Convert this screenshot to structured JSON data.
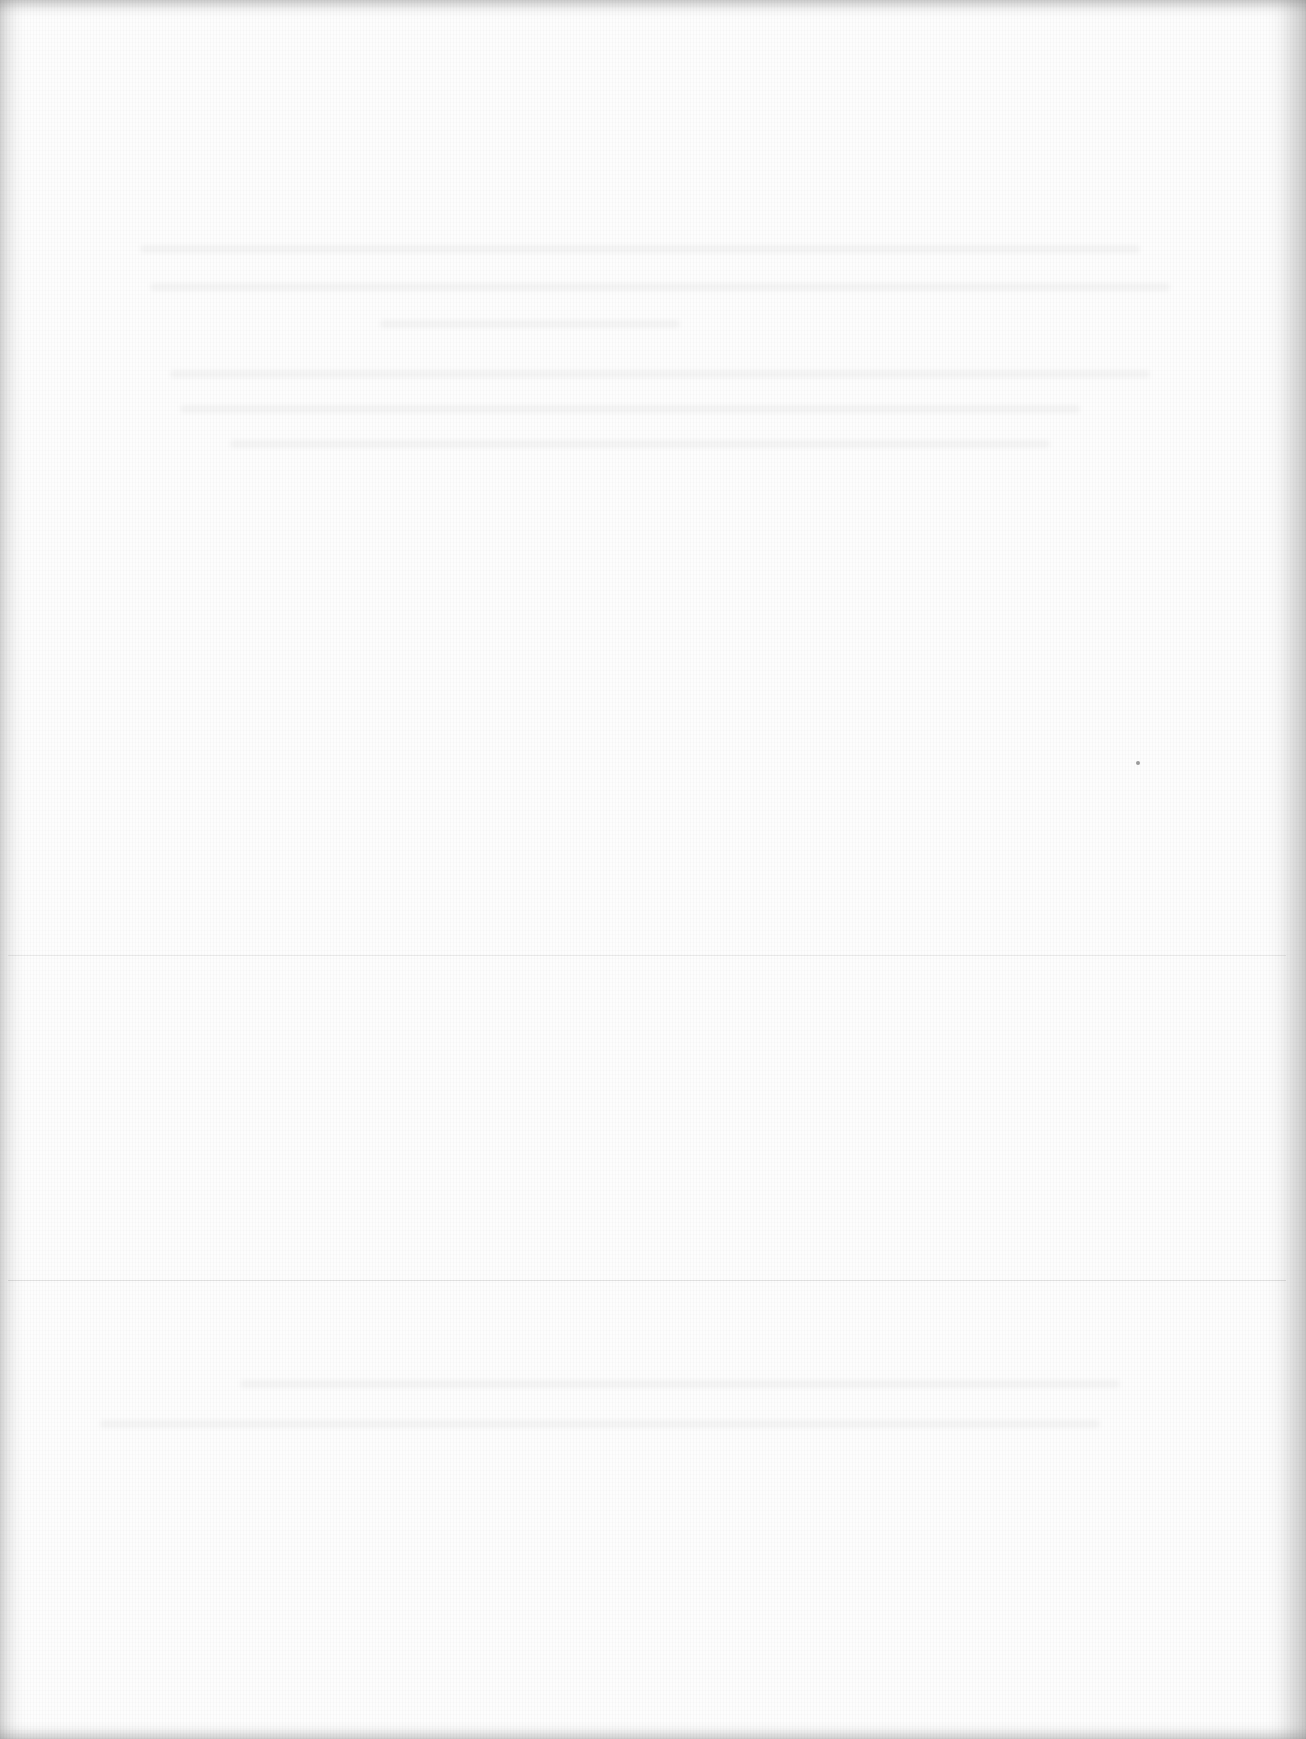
{
  "page": {
    "type": "blank scanned page",
    "background_color": "#fdfdfd",
    "edge_shadow_color": "#c8c8c8",
    "legible_text": []
  },
  "rules": [
    {
      "y": 955,
      "color": "#e4e4e4"
    },
    {
      "y": 1280,
      "color": "#dcdcdc"
    }
  ],
  "marks": [
    {
      "x": 1138,
      "y": 763,
      "color": "#9a9a9a"
    }
  ],
  "bleed_through_lines": [
    {
      "x": 140,
      "y": 245,
      "w": 1000
    },
    {
      "x": 150,
      "y": 283,
      "w": 1020
    },
    {
      "x": 380,
      "y": 320,
      "w": 300
    },
    {
      "x": 170,
      "y": 370,
      "w": 980
    },
    {
      "x": 180,
      "y": 405,
      "w": 900
    },
    {
      "x": 230,
      "y": 440,
      "w": 820
    },
    {
      "x": 240,
      "y": 1380,
      "w": 880
    },
    {
      "x": 100,
      "y": 1420,
      "w": 1000
    }
  ]
}
